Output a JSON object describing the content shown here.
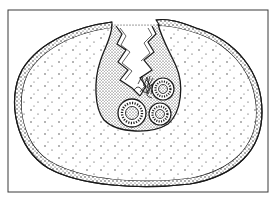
{
  "figure": {
    "type": "biological line illustration",
    "colors": {
      "background": "#ffffff",
      "ink": "#1a1a1a",
      "frame": "#3a3a3a"
    },
    "frame": {
      "x": 8,
      "y": 10,
      "width": 260,
      "height": 182
    },
    "outer_body": {
      "cx": 138,
      "cy": 107,
      "rx": 124,
      "ry": 79
    },
    "pouch": {
      "x_range": [
        96,
        178
      ],
      "y_range": [
        22,
        128
      ]
    },
    "inner_discs": [
      {
        "cx": 132,
        "cy": 113,
        "r": 14
      },
      {
        "cx": 160,
        "cy": 114,
        "r": 11
      },
      {
        "cx": 163,
        "cy": 89,
        "r": 11
      }
    ]
  }
}
